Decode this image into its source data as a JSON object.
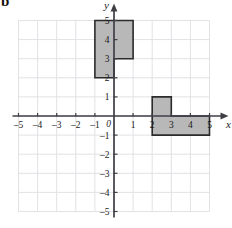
{
  "part_label": "b",
  "axes": {
    "x_axis_label": "x",
    "y_axis_label": "y",
    "origin_label": "0",
    "x_ticks": [
      "-5",
      "-4",
      "-3",
      "-2",
      "-1",
      "1",
      "2",
      "3",
      "4",
      "5"
    ],
    "y_ticks": [
      "5",
      "4",
      "3",
      "2",
      "1",
      "-1",
      "-2",
      "-3",
      "-4",
      "-5"
    ],
    "x_min": -5,
    "x_max": 5,
    "y_min": -5,
    "y_max": 5
  },
  "colors": {
    "grid": "#e2e2e6",
    "axis": "#3f3f46",
    "shape_fill": "#b8b8b8",
    "shape_stroke": "#2b2b2b",
    "label": "#1a1a1a"
  },
  "chart_data": {
    "type": "scatter",
    "title": "",
    "xlabel": "x",
    "ylabel": "y",
    "xlim": [
      -5,
      5
    ],
    "ylim": [
      -5,
      5
    ],
    "grid": true,
    "legend": "none",
    "shapes": [
      {
        "name": "upper-l-shape",
        "description": "L-shaped polygon in the second and first quadrants",
        "vertices": [
          [
            -1,
            5
          ],
          [
            0,
            5
          ],
          [
            1,
            5
          ],
          [
            1,
            3
          ],
          [
            0,
            3
          ],
          [
            0,
            2
          ],
          [
            -1,
            2
          ]
        ],
        "outline": [
          [
            -1,
            5
          ],
          [
            1,
            5
          ],
          [
            1,
            3
          ],
          [
            0,
            3
          ],
          [
            0,
            2
          ],
          [
            -1,
            2
          ]
        ],
        "rectangles": [
          {
            "x0": -1,
            "y0": 2,
            "x1": 0,
            "y1": 5
          },
          {
            "x0": 0,
            "y0": 2,
            "x1": 1,
            "y1": 3
          }
        ]
      },
      {
        "name": "lower-l-shape",
        "description": "L-shaped polygon straddling the x-axis in the first and fourth quadrants",
        "outline": [
          [
            2,
            1
          ],
          [
            3,
            1
          ],
          [
            3,
            0
          ],
          [
            5,
            0
          ],
          [
            5,
            -1
          ],
          [
            2,
            -1
          ]
        ],
        "rectangles": [
          {
            "x0": 2,
            "y0": -1,
            "x1": 5,
            "y1": 0
          },
          {
            "x0": 2,
            "y0": 0,
            "x1": 3,
            "y1": 1
          }
        ]
      }
    ]
  }
}
